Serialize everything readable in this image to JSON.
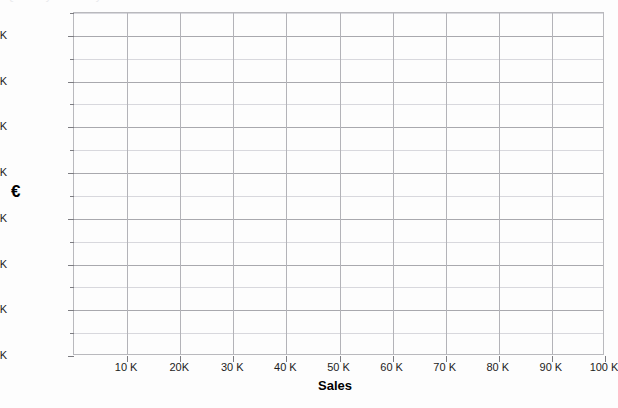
{
  "artifact": {
    "top_cut_text": "Quarterly Summary"
  },
  "chart_data": {
    "type": "line",
    "title": "",
    "subtitle": "",
    "xlabel": "Sales",
    "ylabel": "€",
    "xlim": [
      0,
      100000
    ],
    "ylim": [
      0,
      750000
    ],
    "grid": true,
    "legend": null,
    "series": [],
    "values": [],
    "x": [],
    "categories": [],
    "annotations": [],
    "y_axis": {
      "label": "€",
      "major_ticks": [
        {
          "value": 0,
          "label": "0 K"
        },
        {
          "value": 100000,
          "label": "100 K"
        },
        {
          "value": 200000,
          "label": "200 K"
        },
        {
          "value": 300000,
          "label": "300 K"
        },
        {
          "value": 400000,
          "label": "400 K"
        },
        {
          "value": 500000,
          "label": "500 K"
        },
        {
          "value": 600000,
          "label": "600 K"
        },
        {
          "value": 700000,
          "label": "700 K"
        }
      ],
      "minor_ticks": [
        50000,
        150000,
        250000,
        350000,
        450000,
        550000,
        650000,
        750000
      ],
      "min": 0,
      "max": 750000
    },
    "x_axis": {
      "label": "Sales",
      "major_ticks": [
        {
          "value": 10000,
          "label": "10 K"
        },
        {
          "value": 20000,
          "label": "20K"
        },
        {
          "value": 30000,
          "label": "30 K"
        },
        {
          "value": 40000,
          "label": "40 K"
        },
        {
          "value": 50000,
          "label": "50 K"
        },
        {
          "value": 60000,
          "label": "60 K"
        },
        {
          "value": 70000,
          "label": "70 K"
        },
        {
          "value": 80000,
          "label": "80 K"
        },
        {
          "value": 90000,
          "label": "90 K"
        },
        {
          "value": 100000,
          "label": "100 K"
        }
      ],
      "min": 0,
      "max": 100000
    },
    "colors": {
      "background": "#fdfdfd",
      "plot_background": "#fdfdfd",
      "frame": "#b9b9bd",
      "gridline_major": "#a9a9ae",
      "gridline_minor": "#d8d8dd",
      "gridline_vertical": "#b3b3b8",
      "text": "#1c1c1c",
      "axis_title": "#000000"
    }
  }
}
